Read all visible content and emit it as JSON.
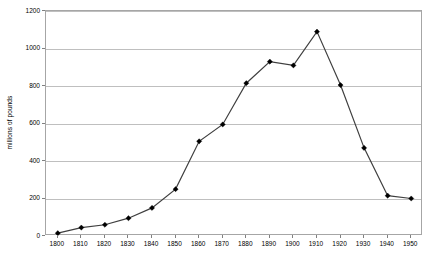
{
  "chart_data": {
    "type": "line",
    "title": "",
    "subtitle": "",
    "xlabel": "",
    "ylabel": "millions of pounds",
    "categories": [
      "1800",
      "1810",
      "1820",
      "1830",
      "1840",
      "1850",
      "1860",
      "1870",
      "1880",
      "1890",
      "1900",
      "1910",
      "1920",
      "1930",
      "1940",
      "1950"
    ],
    "x": [
      1800,
      1810,
      1820,
      1830,
      1840,
      1850,
      1860,
      1870,
      1880,
      1890,
      1900,
      1910,
      1920,
      1930,
      1940,
      1950
    ],
    "values": [
      15,
      45,
      60,
      95,
      150,
      250,
      505,
      595,
      815,
      930,
      910,
      1090,
      805,
      470,
      215,
      200
    ],
    "series": [
      {
        "name": "millions of pounds",
        "values": [
          15,
          45,
          60,
          95,
          150,
          250,
          505,
          595,
          815,
          930,
          910,
          1090,
          805,
          470,
          215,
          200
        ]
      }
    ],
    "xlim": [
      1795,
      1955
    ],
    "ylim": [
      0,
      1200
    ],
    "yticks": [
      0,
      200,
      400,
      600,
      800,
      1000,
      1200
    ],
    "ytick_labels": [
      "0",
      "200",
      "400",
      "600",
      "800",
      "1000",
      "1200"
    ],
    "xtick_labels": [
      "1800",
      "1810",
      "1820",
      "1830",
      "1840",
      "1850",
      "1860",
      "1870",
      "1880",
      "1890",
      "1900",
      "1910",
      "1920",
      "1930",
      "1940",
      "1950"
    ],
    "grid": "horizontal",
    "legend": "none",
    "marker": "filled-diamond",
    "colors": {
      "line": "#3f3f3f",
      "marker": "#000000",
      "gridline": "#bfbfbf",
      "frame": "#a6a6a6",
      "text": "#000000",
      "background": "#ffffff"
    }
  }
}
